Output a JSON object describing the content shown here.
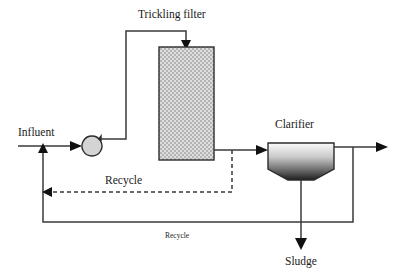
{
  "diagram": {
    "background_color": "#ffffff",
    "line_color": "#3a3a3a",
    "labels": {
      "influent": "Influent",
      "trickling_filter": "Trickling filter",
      "clarifier": "Clarifier",
      "sludge": "Sludge",
      "recycle_upper": "Recycle",
      "recycle_lower": "Recycle"
    },
    "units": [
      {
        "id": "pump",
        "name": "pump",
        "shape": "circle-with-discharge-tab",
        "fill": "#d4d4d4",
        "outline": "#2b2b2b",
        "cx": 92,
        "cy": 146,
        "r": 10
      },
      {
        "id": "trickling-filter",
        "name": "trickling filter",
        "label": "Trickling filter",
        "shape": "rectangle-hatched",
        "fill": "#d9d9d9",
        "pattern": "checkered-dot",
        "x": 159,
        "y": 47,
        "width": 55,
        "height": 113
      },
      {
        "id": "clarifier",
        "name": "clarifier",
        "label": "Clarifier",
        "shape": "rectangle-with-hopper",
        "fill_top": "#f2f2f2",
        "fill_bottom": "#2a2a2a",
        "x": 268,
        "y": 143,
        "width": 66,
        "body_height": 26,
        "hopper_depth": 11
      }
    ],
    "streams": [
      {
        "id": "influent-in",
        "name": "influent inlet line",
        "style": "solid",
        "arrow": "right"
      },
      {
        "id": "pump-to-filter",
        "name": "pump to trickling filter line",
        "style": "solid",
        "arrow": "down"
      },
      {
        "id": "filter-to-clar",
        "name": "filter to clarifier line",
        "style": "solid",
        "arrow": "right"
      },
      {
        "id": "effluent-out",
        "name": "effluent outlet line",
        "style": "solid",
        "arrow": "right"
      },
      {
        "id": "sludge-out",
        "name": "sludge draw-off line",
        "style": "solid",
        "arrow": "down"
      },
      {
        "id": "recycle-upper",
        "name": "filter recycle line",
        "style": "dashed",
        "arrow": "left",
        "label": "Recycle"
      },
      {
        "id": "recycle-lower",
        "name": "clarifier recycle line",
        "style": "solid",
        "arrow": "up",
        "label": "Recycle"
      }
    ]
  }
}
